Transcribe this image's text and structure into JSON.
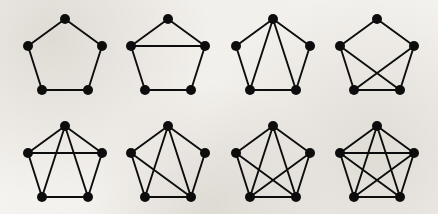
{
  "figure": {
    "background_color": "#f5f3f0",
    "ink_color": "#0d0d0d",
    "vertex_radius": 5.0,
    "edge_width": 1.9,
    "rows": 2,
    "columns": 4,
    "panel_width": 105,
    "panel_height": 107,
    "vertex_count_per_graph": 5,
    "vertex_labels": [
      "top",
      "right-mid",
      "bottom-right",
      "bottom-left",
      "left-mid"
    ],
    "vertex_layout": [
      {
        "name": "top",
        "x": 50.0,
        "y": 11.0
      },
      {
        "name": "right-mid",
        "x": 87.0,
        "y": 38.0
      },
      {
        "name": "bottom-right",
        "x": 73.0,
        "y": 82.0
      },
      {
        "name": "bottom-left",
        "x": 27.0,
        "y": 82.0
      },
      {
        "name": "left-mid",
        "x": 13.0,
        "y": 38.0
      }
    ],
    "panel_origins": [
      {
        "name": "panel-1",
        "x": 15,
        "y": 8
      },
      {
        "name": "panel-2",
        "x": 118,
        "y": 8
      },
      {
        "name": "panel-3",
        "x": 223,
        "y": 8
      },
      {
        "name": "panel-4",
        "x": 327,
        "y": 8
      },
      {
        "name": "panel-5",
        "x": 15,
        "y": 115
      },
      {
        "name": "panel-6",
        "x": 118,
        "y": 115
      },
      {
        "name": "panel-7",
        "x": 223,
        "y": 115
      },
      {
        "name": "panel-8",
        "x": 327,
        "y": 115
      }
    ],
    "graphs": [
      {
        "id": "graph-1",
        "name": "pentagon-cycle",
        "edge_count": 5,
        "edges": [
          [
            0,
            1
          ],
          [
            1,
            2
          ],
          [
            2,
            3
          ],
          [
            3,
            4
          ],
          [
            4,
            0
          ]
        ]
      },
      {
        "id": "graph-2",
        "name": "pentagon-plus-one-chord",
        "edge_count": 6,
        "edges": [
          [
            0,
            1
          ],
          [
            1,
            2
          ],
          [
            2,
            3
          ],
          [
            3,
            4
          ],
          [
            4,
            0
          ],
          [
            4,
            1
          ]
        ]
      },
      {
        "id": "graph-3",
        "name": "pentagon-plus-two-apex-chords",
        "edge_count": 7,
        "edges": [
          [
            0,
            1
          ],
          [
            1,
            2
          ],
          [
            2,
            3
          ],
          [
            3,
            4
          ],
          [
            4,
            0
          ],
          [
            0,
            2
          ],
          [
            0,
            3
          ]
        ]
      },
      {
        "id": "graph-4",
        "name": "pentagon-plus-crossing-diagonals",
        "edge_count": 7,
        "edges": [
          [
            0,
            1
          ],
          [
            1,
            2
          ],
          [
            2,
            3
          ],
          [
            3,
            4
          ],
          [
            4,
            0
          ],
          [
            4,
            2
          ],
          [
            1,
            3
          ]
        ]
      },
      {
        "id": "graph-5",
        "name": "pentagon-plus-horizontal-and-apex-chords",
        "edge_count": 8,
        "edges": [
          [
            0,
            1
          ],
          [
            1,
            2
          ],
          [
            2,
            3
          ],
          [
            3,
            4
          ],
          [
            4,
            0
          ],
          [
            4,
            1
          ],
          [
            0,
            2
          ],
          [
            0,
            3
          ]
        ]
      },
      {
        "id": "graph-6",
        "name": "pentagon-plus-apex-chords-and-one-diagonal",
        "edge_count": 8,
        "edges": [
          [
            0,
            1
          ],
          [
            1,
            2
          ],
          [
            2,
            3
          ],
          [
            3,
            4
          ],
          [
            4,
            0
          ],
          [
            0,
            2
          ],
          [
            0,
            3
          ],
          [
            4,
            2
          ]
        ]
      },
      {
        "id": "graph-7",
        "name": "pentagon-plus-apex-chords-and-both-diagonals",
        "edge_count": 9,
        "edges": [
          [
            0,
            1
          ],
          [
            1,
            2
          ],
          [
            2,
            3
          ],
          [
            3,
            4
          ],
          [
            4,
            0
          ],
          [
            0,
            2
          ],
          [
            0,
            3
          ],
          [
            4,
            2
          ],
          [
            1,
            3
          ]
        ]
      },
      {
        "id": "graph-8",
        "name": "complete-graph-k5",
        "edge_count": 10,
        "edges": [
          [
            0,
            1
          ],
          [
            1,
            2
          ],
          [
            2,
            3
          ],
          [
            3,
            4
          ],
          [
            4,
            0
          ],
          [
            0,
            2
          ],
          [
            0,
            3
          ],
          [
            1,
            3
          ],
          [
            1,
            4
          ],
          [
            2,
            4
          ]
        ]
      }
    ]
  }
}
